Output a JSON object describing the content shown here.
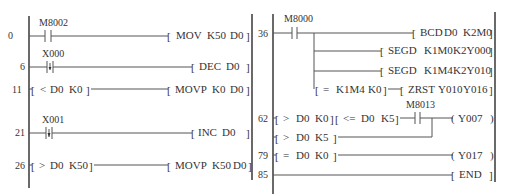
{
  "left_panel": {
    "rungs": [
      {
        "step": "0",
        "contact": {
          "type": "NO",
          "label": "M8002"
        },
        "instruction": [
          "MOV",
          "K50",
          "D0"
        ]
      },
      {
        "step": "6",
        "contact": {
          "type": "falling-edge",
          "label": "X000"
        },
        "instruction": [
          "DEC",
          "D0"
        ]
      },
      {
        "step": "11",
        "compare": [
          "<",
          "D0",
          "K0"
        ],
        "instruction": [
          "MOVP",
          "K0",
          "D0"
        ]
      },
      {
        "step": "21",
        "contact": {
          "type": "rising-edge",
          "label": "X001"
        },
        "instruction": [
          "INC",
          "D0"
        ]
      },
      {
        "step": "26",
        "compare": [
          ">",
          "D0",
          "K50"
        ],
        "instruction": [
          "MOVP",
          "K50",
          "D0"
        ]
      }
    ]
  },
  "right_panel": {
    "rungs": [
      {
        "step": "36",
        "contact": {
          "type": "NO",
          "label": "M8000"
        },
        "branches": [
          {
            "instruction": [
              "BCD",
              "D0",
              "K2M0"
            ]
          },
          {
            "instruction": [
              "SEGD",
              "K1M0",
              "K2Y000"
            ]
          },
          {
            "instruction": [
              "SEGD",
              "K1M4",
              "K2Y010"
            ]
          },
          {
            "compare": [
              "=",
              "K1M4",
              "K0"
            ],
            "instruction": [
              "ZRST",
              "Y010",
              "Y016"
            ]
          }
        ]
      },
      {
        "step": "62",
        "compare1": [
          ">",
          "D0",
          "K0"
        ],
        "compare2": [
          "<=",
          "D0",
          "K5"
        ],
        "contact": {
          "type": "NO",
          "label": "M8013"
        },
        "parallel_compare": [
          ">",
          "D0",
          "K5"
        ],
        "coil": "Y007"
      },
      {
        "step": "79",
        "compare": [
          "=",
          "D0",
          "K0"
        ],
        "coil": "Y017"
      },
      {
        "step": "85",
        "instruction": [
          "END"
        ]
      }
    ]
  }
}
